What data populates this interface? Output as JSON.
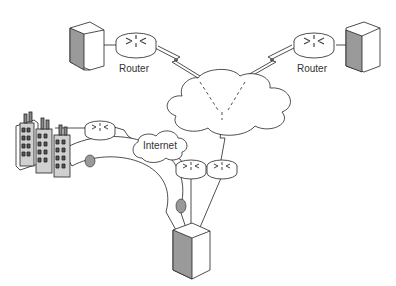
{
  "diagram": {
    "type": "network-topology",
    "nodes": [
      {
        "id": "server-left",
        "kind": "server"
      },
      {
        "id": "router-left",
        "kind": "router",
        "label": "Router"
      },
      {
        "id": "router-right",
        "kind": "router",
        "label": "Router"
      },
      {
        "id": "server-right",
        "kind": "server"
      },
      {
        "id": "wan-cloud",
        "kind": "cloud"
      },
      {
        "id": "internet-cloud",
        "kind": "cloud",
        "label": "Internet"
      },
      {
        "id": "buildings",
        "kind": "office-buildings"
      },
      {
        "id": "router-building",
        "kind": "router"
      },
      {
        "id": "router-bottom-a",
        "kind": "router"
      },
      {
        "id": "router-bottom-b",
        "kind": "router"
      },
      {
        "id": "server-bottom",
        "kind": "server"
      }
    ],
    "edges": [
      {
        "from": "server-left",
        "to": "router-left",
        "style": "line"
      },
      {
        "from": "router-left",
        "to": "wan-cloud",
        "style": "lightning"
      },
      {
        "from": "router-right",
        "to": "wan-cloud",
        "style": "lightning"
      },
      {
        "from": "server-right",
        "to": "router-right",
        "style": "line"
      },
      {
        "from": "wan-cloud",
        "to": "router-bottom-b",
        "style": "lightning"
      },
      {
        "from": "buildings",
        "to": "router-building",
        "style": "line"
      },
      {
        "from": "router-building",
        "to": "internet-cloud",
        "style": "lightning"
      },
      {
        "from": "internet-cloud",
        "to": "router-bottom-a",
        "style": "lightning"
      },
      {
        "from": "router-bottom-a",
        "to": "server-bottom",
        "style": "line"
      },
      {
        "from": "router-bottom-b",
        "to": "server-bottom",
        "style": "line"
      },
      {
        "from": "buildings",
        "to": "server-bottom",
        "style": "tunnel"
      }
    ]
  },
  "labels": {
    "router_left": "Router",
    "router_right": "Router",
    "internet": "Internet"
  },
  "colors": {
    "stroke": "#222222",
    "shade": "#9a9a9a",
    "fill": "#ffffff"
  }
}
